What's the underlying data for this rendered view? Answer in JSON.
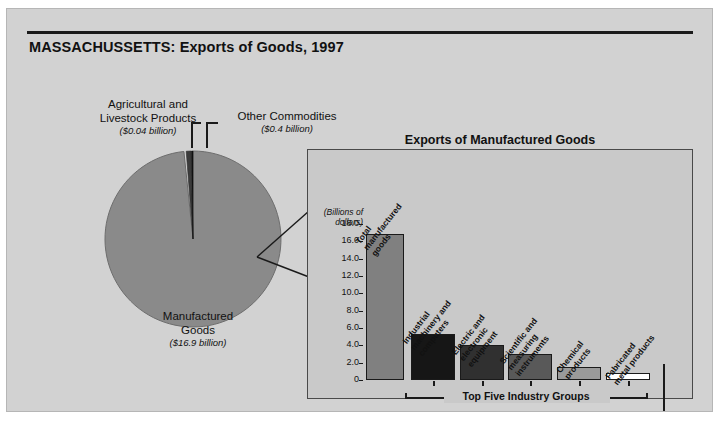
{
  "title": "MASSACHUSSETTS: Exports of Goods, 1997",
  "pie": {
    "labels": {
      "agricultural": {
        "name": "Agricultural and\nLivestock Products",
        "value": "($0.04 billion)"
      },
      "other": {
        "name": "Other Commodities",
        "value": "($0.4 billion)"
      },
      "manufactured": {
        "name": "Manufactured\nGoods",
        "value": "($16.9 billion)"
      }
    }
  },
  "panel": {
    "title": "Exports of Manufactured Goods",
    "axis_caption": "(Billions of\ndollars)",
    "bracket_label": "Top Five Industry Groups"
  },
  "chart_data": {
    "type": "bar",
    "title": "Exports of Manufactured Goods",
    "xlabel": "",
    "ylabel": "(Billions of dollars)",
    "ylim": [
      0,
      18.0
    ],
    "yticks": [
      "0",
      "2.0",
      "4.0",
      "6.0",
      "8.0",
      "10.0",
      "12.0",
      "14.0",
      "16.0",
      "18.0"
    ],
    "ytick_values": [
      0,
      2.0,
      4.0,
      6.0,
      8.0,
      10.0,
      12.0,
      14.0,
      16.0,
      18.0
    ],
    "grid": false,
    "legend": "none",
    "categories": [
      "Total manufactured goods",
      "Industrial machinery and computers",
      "Electric and electronic equipment",
      "Scientific and measuring instruments",
      "Chemical products",
      "Fabricated metal products"
    ],
    "values": [
      16.9,
      5.3,
      4.0,
      3.0,
      1.5,
      0.8
    ],
    "colors": [
      "#808080",
      "#161616",
      "#303030",
      "#595959",
      "#9a9a9a",
      "#ffffff"
    ],
    "annotations": [
      "Top Five Industry Groups"
    ],
    "pie_companion": {
      "type": "pie",
      "labels": [
        "Manufactured Goods",
        "Agricultural and Livestock Products",
        "Other Commodities"
      ],
      "values": [
        16.9,
        0.04,
        0.4
      ],
      "value_labels": [
        "($16.9 billion)",
        "($0.04 billion)",
        "($0.4 billion)"
      ],
      "colors": [
        "#8a8a8a",
        "#111111",
        "#3b3b3b"
      ]
    }
  }
}
